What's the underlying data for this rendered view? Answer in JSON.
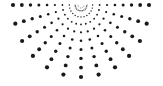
{
  "graphic": {
    "name": "halftone-radial-sunburst",
    "dot_color": "#1a1a1a",
    "background": "#ffffff",
    "center": [
      81,
      5
    ],
    "ray_count": 13,
    "angle_start_deg": 0,
    "angle_end_deg": 180,
    "inner_radius": 6,
    "outer_radius_x": 68,
    "outer_radius_y": 72,
    "dots_per_ray": 9,
    "min_dot_radius": 0.5,
    "max_dot_radius": 2.1
  }
}
